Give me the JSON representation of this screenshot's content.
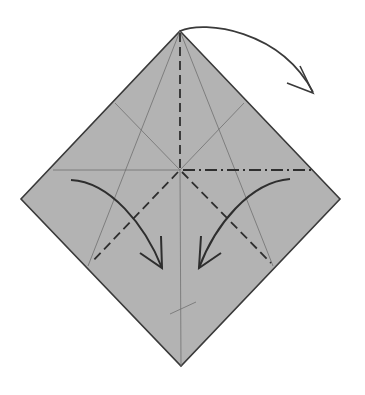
{
  "diagram": {
    "type": "origami-fold-step",
    "paper_color": "#b3b3b3",
    "edge_color": "#3a3a3a",
    "crease_color": "#6e6e6e",
    "fold_line_color": "#2e2e2e",
    "arrow_color": "#3a3a3a",
    "elements": [
      "square paper shown as diamond",
      "valley fold (dashed) vertical from top corner to center",
      "mountain fold (dash-dot) horizontal right half",
      "valley folds (dashed) from center to lower-left and lower-right edges",
      "curved arrow at top corner pointing right/down",
      "curved arrows left and right pointing inward and down"
    ]
  }
}
